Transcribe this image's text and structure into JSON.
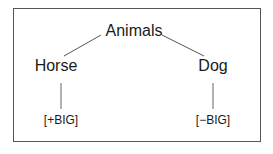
{
  "diagram": {
    "type": "tree",
    "root": {
      "label": "Animals"
    },
    "children": [
      {
        "label": "Horse",
        "feature": "[+BIG]"
      },
      {
        "label": "Dog",
        "feature": "[−BIG]"
      }
    ]
  }
}
